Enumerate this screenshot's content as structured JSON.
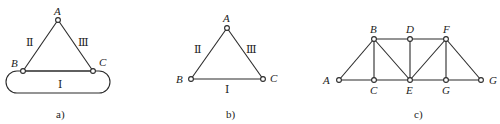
{
  "figures": [
    {
      "id": "a",
      "caption": "a)",
      "nodes": [
        {
          "name": "A",
          "x": 58,
          "y": 20
        },
        {
          "name": "B",
          "x": 23,
          "y": 71
        },
        {
          "name": "C",
          "x": 93,
          "y": 71
        }
      ],
      "edges": [
        [
          "A",
          "B"
        ],
        [
          "A",
          "C"
        ],
        [
          "B",
          "C"
        ]
      ],
      "regions": {
        "left": "Ⅱ",
        "right": "Ⅲ",
        "bottom": "Ⅰ"
      },
      "ground_shape": "rounded-rectangle"
    },
    {
      "id": "b",
      "caption": "b)",
      "nodes": [
        {
          "name": "A",
          "x": 227,
          "y": 28
        },
        {
          "name": "B",
          "x": 191,
          "y": 79
        },
        {
          "name": "C",
          "x": 263,
          "y": 79
        }
      ],
      "edges": [
        [
          "A",
          "B"
        ],
        [
          "A",
          "C"
        ],
        [
          "B",
          "C"
        ]
      ],
      "regions": {
        "left": "Ⅱ",
        "right": "Ⅲ",
        "bottom": "Ⅰ"
      }
    },
    {
      "id": "c",
      "caption": "c)",
      "nodes": [
        {
          "name": "A",
          "x": 339,
          "y": 80
        },
        {
          "name": "B",
          "x": 374,
          "y": 39
        },
        {
          "name": "C",
          "x": 374,
          "y": 80
        },
        {
          "name": "D",
          "x": 410,
          "y": 39
        },
        {
          "name": "E",
          "x": 410,
          "y": 80
        },
        {
          "name": "F",
          "x": 446,
          "y": 39
        },
        {
          "name": "G",
          "x": 446,
          "y": 80
        },
        {
          "name": "G",
          "x": 481,
          "y": 80
        }
      ],
      "edges": [
        [
          "A",
          "B"
        ],
        [
          "A",
          "C"
        ],
        [
          "B",
          "C"
        ],
        [
          "B",
          "D"
        ],
        [
          "B",
          "E"
        ],
        [
          "C",
          "E"
        ],
        [
          "D",
          "E"
        ],
        [
          "D",
          "F"
        ],
        [
          "E",
          "F"
        ],
        [
          "E",
          "G"
        ],
        [
          "F",
          "G"
        ],
        [
          "F",
          "G2"
        ],
        [
          "G",
          "G2"
        ]
      ]
    }
  ],
  "labels": {
    "a_A": "A",
    "a_B": "B",
    "a_C": "C",
    "a_II": "Ⅱ",
    "a_III": "Ⅲ",
    "a_I": "Ⅰ",
    "b_A": "A",
    "b_B": "B",
    "b_C": "C",
    "b_II": "Ⅱ",
    "b_III": "Ⅲ",
    "b_I": "Ⅰ",
    "c_A": "A",
    "c_B": "B",
    "c_C": "C",
    "c_D": "D",
    "c_E": "E",
    "c_F": "F",
    "c_G": "G",
    "c_G2": "G",
    "cap_a": "a)",
    "cap_b": "b)",
    "cap_c": "c)"
  }
}
